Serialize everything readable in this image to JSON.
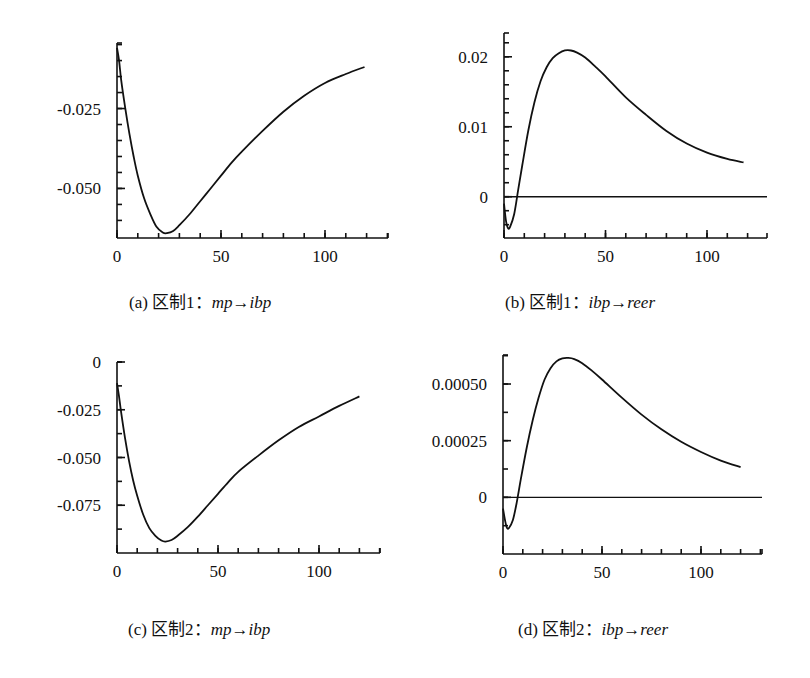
{
  "panels": [
    {
      "id": "a",
      "caption_prefix": "(a) 区制1：",
      "caption_math": "mp→ibp",
      "box": {
        "left": 117,
        "top": 43,
        "right": 388,
        "bottom": 238
      },
      "xlim": [
        0,
        130
      ],
      "ylim": [
        -0.0655,
        -0.0045
      ],
      "x_px_per_unit": 2.08,
      "yticks": [
        {
          "v": -0.025,
          "label": "-0.025"
        },
        {
          "v": -0.05,
          "label": "-0.050"
        }
      ],
      "minor_y_step": 0.005,
      "xticks": [
        {
          "v": 0,
          "label": "0"
        },
        {
          "v": 50,
          "label": "50"
        },
        {
          "v": 100,
          "label": "100"
        }
      ],
      "minor_x_step": 10,
      "zero_line": false
    },
    {
      "id": "b",
      "caption_prefix": "(b) 区制1：",
      "caption_math": "ibp→reer",
      "box": {
        "left": 504,
        "top": 33,
        "right": 767,
        "bottom": 238
      },
      "xlim": [
        0,
        130
      ],
      "ylim": [
        -0.0059,
        0.0234
      ],
      "x_px_per_unit": 2.03,
      "yticks": [
        {
          "v": 0,
          "label": "0"
        },
        {
          "v": 0.01,
          "label": "0.01"
        },
        {
          "v": 0.02,
          "label": "0.02"
        }
      ],
      "minor_y_step": 0.002,
      "xticks": [
        {
          "v": 0,
          "label": "0"
        },
        {
          "v": 50,
          "label": "50"
        },
        {
          "v": 100,
          "label": "100"
        }
      ],
      "minor_x_step": 10,
      "zero_line": true
    },
    {
      "id": "c",
      "caption_prefix": "(c) 区制2：",
      "caption_math": "mp→ibp",
      "box": {
        "left": 117,
        "top": 362,
        "right": 380,
        "bottom": 553
      },
      "xlim": [
        0,
        130
      ],
      "ylim": [
        -0.1,
        0
      ],
      "x_px_per_unit": 2.02,
      "yticks": [
        {
          "v": 0,
          "label": "0"
        },
        {
          "v": -0.025,
          "label": "-0.025"
        },
        {
          "v": -0.05,
          "label": "-0.050"
        },
        {
          "v": -0.075,
          "label": "-0.075"
        }
      ],
      "minor_y_step": 0.0125,
      "xticks": [
        {
          "v": 0,
          "label": "0"
        },
        {
          "v": 50,
          "label": "50"
        },
        {
          "v": 100,
          "label": "100"
        }
      ],
      "minor_x_step": 10,
      "zero_line": false
    },
    {
      "id": "d",
      "caption_prefix": "(d) 区制2：",
      "caption_math": "ibp→reer",
      "box": {
        "left": 503,
        "top": 355,
        "right": 762,
        "bottom": 554
      },
      "xlim": [
        0,
        130
      ],
      "ylim": [
        -0.00025,
        0.000628
      ],
      "x_px_per_unit": 1.98,
      "yticks": [
        {
          "v": 0,
          "label": "0"
        },
        {
          "v": 0.00025,
          "label": "0.00025"
        },
        {
          "v": 0.0005,
          "label": "0.00050"
        }
      ],
      "minor_y_step": 0.000125,
      "xticks": [
        {
          "v": 0,
          "label": "0"
        },
        {
          "v": 50,
          "label": "50"
        },
        {
          "v": 100,
          "label": "100"
        }
      ],
      "minor_x_step": 10,
      "zero_line": true
    }
  ],
  "chart_data": [
    {
      "type": "line",
      "title": "(a) 区制1：mp→ibp",
      "xlabel": "",
      "ylabel": "",
      "xlim": [
        0,
        130
      ],
      "ylim": [
        -0.065,
        -0.005
      ],
      "xticks": [
        0,
        50,
        100
      ],
      "yticks": [
        -0.025,
        -0.05
      ],
      "grid": false,
      "series": [
        {
          "name": "mp→ibp (regime 1)",
          "x": [
            0,
            1,
            2,
            4,
            6,
            8,
            10,
            13,
            16,
            19,
            22,
            24,
            27,
            30,
            35,
            40,
            45,
            50,
            55,
            60,
            70,
            80,
            90,
            100,
            110,
            119
          ],
          "y": [
            -0.006,
            -0.01,
            -0.016,
            -0.025,
            -0.033,
            -0.04,
            -0.046,
            -0.053,
            -0.058,
            -0.062,
            -0.0638,
            -0.064,
            -0.0633,
            -0.0615,
            -0.058,
            -0.054,
            -0.05,
            -0.046,
            -0.042,
            -0.0385,
            -0.032,
            -0.026,
            -0.021,
            -0.017,
            -0.0142,
            -0.012
          ]
        }
      ]
    },
    {
      "type": "line",
      "title": "(b) 区制1：ibp→reer",
      "xlabel": "",
      "ylabel": "",
      "xlim": [
        0,
        130
      ],
      "ylim": [
        -0.006,
        0.023
      ],
      "xticks": [
        0,
        50,
        100
      ],
      "yticks": [
        0,
        0.01,
        0.02
      ],
      "grid": false,
      "zero_line": true,
      "series": [
        {
          "name": "ibp→reer (regime 1)",
          "x": [
            0,
            1,
            2,
            3,
            5,
            7,
            9,
            12,
            15,
            18,
            21,
            24,
            27,
            30,
            33,
            36,
            40,
            45,
            50,
            60,
            70,
            80,
            90,
            100,
            110,
            118
          ],
          "y": [
            -0.001,
            -0.0035,
            -0.0045,
            -0.0043,
            -0.0025,
            0.001,
            0.0045,
            0.0095,
            0.0135,
            0.0165,
            0.0185,
            0.0198,
            0.0205,
            0.0209,
            0.0209,
            0.0206,
            0.0199,
            0.0186,
            0.0172,
            0.0142,
            0.0117,
            0.0094,
            0.0076,
            0.0063,
            0.0054,
            0.0049
          ]
        }
      ]
    },
    {
      "type": "line",
      "title": "(c) 区制2：mp→ibp",
      "xlabel": "",
      "ylabel": "",
      "xlim": [
        0,
        130
      ],
      "ylim": [
        -0.1,
        0
      ],
      "xticks": [
        0,
        50,
        100
      ],
      "yticks": [
        0,
        -0.025,
        -0.05,
        -0.075
      ],
      "grid": false,
      "series": [
        {
          "name": "mp→ibp (regime 2)",
          "x": [
            0,
            1,
            2,
            4,
            6,
            8,
            10,
            13,
            16,
            19,
            22,
            24,
            27,
            30,
            35,
            40,
            45,
            50,
            55,
            60,
            70,
            80,
            90,
            100,
            110,
            120
          ],
          "y": [
            -0.011,
            -0.018,
            -0.026,
            -0.04,
            -0.052,
            -0.062,
            -0.07,
            -0.08,
            -0.087,
            -0.091,
            -0.0935,
            -0.094,
            -0.0932,
            -0.091,
            -0.0865,
            -0.081,
            -0.075,
            -0.069,
            -0.063,
            -0.0575,
            -0.049,
            -0.041,
            -0.034,
            -0.0285,
            -0.023,
            -0.018
          ]
        }
      ]
    },
    {
      "type": "line",
      "title": "(d) 区制2：ibp→reer",
      "xlabel": "",
      "ylabel": "",
      "xlim": [
        0,
        130
      ],
      "ylim": [
        -0.00025,
        0.00063
      ],
      "xticks": [
        0,
        50,
        100
      ],
      "yticks": [
        0,
        0.00025,
        0.0005
      ],
      "grid": false,
      "zero_line": true,
      "series": [
        {
          "name": "ibp→reer (regime 2)",
          "x": [
            0,
            1,
            2,
            3,
            5,
            7,
            9,
            12,
            15,
            18,
            21,
            24,
            27,
            30,
            33,
            36,
            40,
            45,
            50,
            60,
            70,
            80,
            90,
            100,
            110,
            120
          ],
          "y": [
            -5e-05,
            -0.0001,
            -0.000135,
            -0.000135,
            -0.0001,
            -2e-05,
            8e-05,
            0.00022,
            0.00034,
            0.00044,
            0.00052,
            0.00057,
            0.0006,
            0.000613,
            0.000615,
            0.00061,
            0.000592,
            0.000558,
            0.00052,
            0.00044,
            0.000365,
            0.0003,
            0.000245,
            0.0002,
            0.000162,
            0.000133
          ]
        }
      ]
    }
  ]
}
